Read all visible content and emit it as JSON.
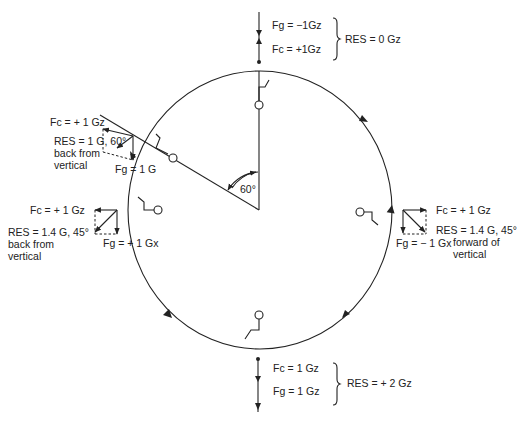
{
  "diagram": {
    "type": "outside loop flight forces diagram",
    "angle_label": "60°",
    "positions": {
      "top": {
        "fg": "Fg = −1Gz",
        "fc": "Fc = +1Gz",
        "res": "RES = 0 Gz"
      },
      "upper_left_60": {
        "fc": "Fc = + 1 Gz",
        "res_line1": "RES = 1 G, 60°",
        "res_line2": "back from",
        "res_line3": "vertical",
        "fg": "Fg = 1 G"
      },
      "left": {
        "fc": "Fc = + 1 Gz",
        "res_line1": "RES = 1.4 G, 45°",
        "res_line2": "back from",
        "res_line3": "vertical",
        "fg": "Fg = + 1 Gx"
      },
      "right": {
        "fc": "Fc = + 1 Gz",
        "res_line1": "RES = 1.4 G, 45°",
        "res_line2": "forward of",
        "res_line3": "vertical",
        "fg": "Fg = − 1 Gx"
      },
      "bottom": {
        "fc": "Fc = 1 Gz",
        "fg": "Fg = 1 Gz",
        "res": "RES = + 2 Gz"
      }
    },
    "colors": {
      "ink": "#222222",
      "background": "#ffffff"
    }
  }
}
